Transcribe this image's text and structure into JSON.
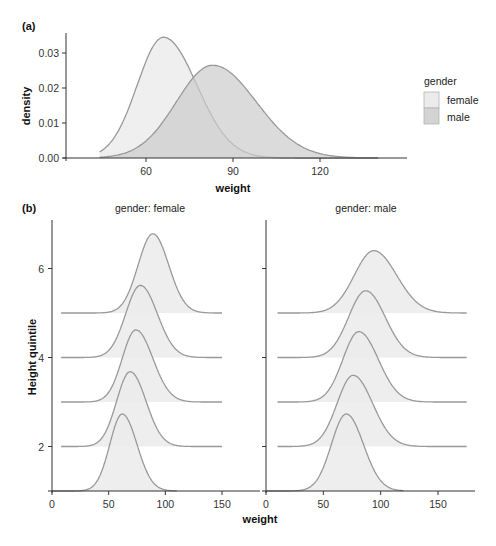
{
  "chart_data": [
    {
      "id": "a",
      "panel_label": "(a)",
      "type": "area",
      "subtype": "density",
      "title": "",
      "xlabel": "weight",
      "ylabel": "density",
      "xlim": [
        38,
        148
      ],
      "ylim": [
        0,
        0.035
      ],
      "xticks": [
        60,
        90,
        120
      ],
      "yticks": [
        0.0,
        0.01,
        0.02,
        0.03
      ],
      "ytick_labels": [
        "0.00",
        "0.01",
        "0.02",
        "0.03"
      ],
      "grid": false,
      "legend": {
        "title": "gender",
        "position": "right",
        "entries": [
          {
            "label": "female",
            "color": "#ebebeb"
          },
          {
            "label": "male",
            "color": "#dcdcdc"
          }
        ]
      },
      "series": [
        {
          "name": "female",
          "peak_x": 66,
          "peak_density": 0.0345,
          "sd_left": 9.0,
          "sd_right": 11.5,
          "color": "#ebebeb",
          "opacity": 0.8
        },
        {
          "name": "male",
          "peak_x": 83,
          "peak_density": 0.0265,
          "sd_left": 12.5,
          "sd_right": 15.0,
          "color": "#cccccc",
          "opacity": 0.7
        }
      ]
    },
    {
      "id": "b",
      "panel_label": "(b)",
      "type": "area",
      "subtype": "ridgeline",
      "xlabel": "weight",
      "ylabel": "Height quintile",
      "xlim": [
        0,
        180
      ],
      "ylim": [
        1,
        7
      ],
      "xticks": [
        0,
        50,
        100,
        150
      ],
      "yticks": [
        2,
        4,
        6
      ],
      "grid": false,
      "facets": [
        {
          "strip": "gender: female",
          "ridges": [
            {
              "quintile": 1,
              "peak_x": 62,
              "x_range": [
                0,
                110
              ],
              "sd_left": 11,
              "sd_right": 13,
              "height": 1.73
            },
            {
              "quintile": 2,
              "peak_x": 69,
              "x_range": [
                8,
                150
              ],
              "sd_left": 12,
              "sd_right": 14,
              "height": 1.68
            },
            {
              "quintile": 3,
              "peak_x": 74,
              "x_range": [
                8,
                150
              ],
              "sd_left": 12,
              "sd_right": 15,
              "height": 1.62
            },
            {
              "quintile": 4,
              "peak_x": 78,
              "x_range": [
                8,
                150
              ],
              "sd_left": 13,
              "sd_right": 15,
              "height": 1.62
            },
            {
              "quintile": 5,
              "peak_x": 89,
              "x_range": [
                8,
                150
              ],
              "sd_left": 13,
              "sd_right": 14,
              "height": 1.78
            }
          ]
        },
        {
          "strip": "gender: male",
          "ridges": [
            {
              "quintile": 1,
              "peak_x": 70,
              "x_range": [
                0,
                120
              ],
              "sd_left": 13,
              "sd_right": 15,
              "height": 1.73
            },
            {
              "quintile": 2,
              "peak_x": 76,
              "x_range": [
                10,
                175
              ],
              "sd_left": 14,
              "sd_right": 17,
              "height": 1.6
            },
            {
              "quintile": 3,
              "peak_x": 81,
              "x_range": [
                10,
                175
              ],
              "sd_left": 14,
              "sd_right": 17,
              "height": 1.58
            },
            {
              "quintile": 4,
              "peak_x": 87,
              "x_range": [
                10,
                175
              ],
              "sd_left": 15,
              "sd_right": 17,
              "height": 1.5
            },
            {
              "quintile": 5,
              "peak_x": 94,
              "x_range": [
                10,
                175
              ],
              "sd_left": 17,
              "sd_right": 20,
              "height": 1.4
            }
          ]
        }
      ],
      "fill_color": "#ebebeb"
    }
  ],
  "colors": {
    "stroke": "#999999",
    "axis": "#333333",
    "female_fill": "#ebebeb",
    "male_fill": "#d3d3d3"
  }
}
